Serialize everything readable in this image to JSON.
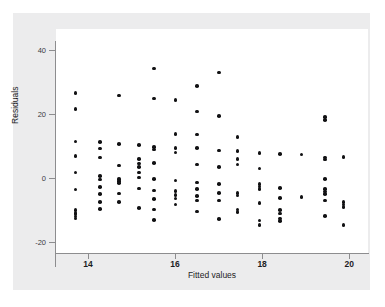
{
  "chart_data": {
    "type": "scatter",
    "title": "",
    "xlabel": "Fitted values",
    "ylabel": "Residuals",
    "xlim": [
      13.55,
      20.1
    ],
    "ylim": [
      -21.5,
      42.5
    ],
    "xticks": [
      14,
      16,
      18,
      20
    ],
    "yticks": [
      40,
      20,
      0,
      -20
    ],
    "xtick_labels": [
      "14",
      "16",
      "18",
      "20"
    ],
    "ytick_labels": [
      "40",
      "20",
      "0",
      "-20"
    ],
    "grid": false,
    "legend": null,
    "marker": "filled-circle",
    "marker_color": "#111113",
    "panel_color": "#ffffff",
    "figure_color": "#ececed",
    "points": [
      [
        13.72,
        26.5
      ],
      [
        13.72,
        21.5
      ],
      [
        13.72,
        11.5
      ],
      [
        13.72,
        7.0
      ],
      [
        13.72,
        1.8
      ],
      [
        13.72,
        -3.5
      ],
      [
        13.72,
        -10.0
      ],
      [
        13.72,
        -10.8
      ],
      [
        13.72,
        -11.4
      ],
      [
        13.72,
        -12.0
      ],
      [
        13.72,
        -12.6
      ],
      [
        14.28,
        11.2
      ],
      [
        14.28,
        9.2
      ],
      [
        14.28,
        6.4
      ],
      [
        14.28,
        0.6
      ],
      [
        14.28,
        -0.4
      ],
      [
        14.28,
        -2.8
      ],
      [
        14.28,
        -5.0
      ],
      [
        14.28,
        -7.4
      ],
      [
        14.28,
        -9.6
      ],
      [
        14.72,
        25.8
      ],
      [
        14.72,
        10.6
      ],
      [
        14.72,
        4.0
      ],
      [
        14.72,
        -0.2
      ],
      [
        14.72,
        -0.9
      ],
      [
        14.72,
        -1.6
      ],
      [
        14.72,
        -4.8
      ],
      [
        14.72,
        -7.4
      ],
      [
        15.18,
        10.4
      ],
      [
        15.18,
        6.0
      ],
      [
        15.18,
        4.6
      ],
      [
        15.18,
        3.4
      ],
      [
        15.18,
        1.8
      ],
      [
        15.18,
        0.2
      ],
      [
        15.18,
        -3.2
      ],
      [
        15.18,
        -9.4
      ],
      [
        15.52,
        34.2
      ],
      [
        15.52,
        24.8
      ],
      [
        15.52,
        9.8
      ],
      [
        15.52,
        9.0
      ],
      [
        15.52,
        4.8
      ],
      [
        15.52,
        -0.2
      ],
      [
        15.52,
        -3.8
      ],
      [
        15.52,
        -6.6
      ],
      [
        15.52,
        -9.8
      ],
      [
        15.52,
        -13.0
      ],
      [
        16.02,
        24.4
      ],
      [
        16.02,
        13.8
      ],
      [
        16.02,
        9.4
      ],
      [
        16.02,
        8.0
      ],
      [
        16.02,
        -0.8
      ],
      [
        16.02,
        -4.0
      ],
      [
        16.02,
        -5.2
      ],
      [
        16.02,
        -6.4
      ],
      [
        16.02,
        -8.2
      ],
      [
        16.52,
        28.8
      ],
      [
        16.52,
        20.8
      ],
      [
        16.52,
        13.6
      ],
      [
        16.52,
        9.4
      ],
      [
        16.52,
        4.2
      ],
      [
        16.52,
        -1.4
      ],
      [
        16.52,
        -3.4
      ],
      [
        16.52,
        -5.6
      ],
      [
        16.52,
        -7.0
      ],
      [
        16.52,
        -10.4
      ],
      [
        17.02,
        33.0
      ],
      [
        17.02,
        19.4
      ],
      [
        17.02,
        8.6
      ],
      [
        17.02,
        3.4
      ],
      [
        17.02,
        -1.8
      ],
      [
        17.02,
        -4.6
      ],
      [
        17.02,
        -7.0
      ],
      [
        17.02,
        -12.8
      ],
      [
        17.45,
        12.8
      ],
      [
        17.45,
        8.4
      ],
      [
        17.45,
        6.0
      ],
      [
        17.45,
        4.2
      ],
      [
        17.45,
        -4.6
      ],
      [
        17.45,
        -5.4
      ],
      [
        17.45,
        -9.8
      ],
      [
        17.45,
        -10.6
      ],
      [
        17.95,
        7.8
      ],
      [
        17.95,
        3.0
      ],
      [
        17.95,
        -1.8
      ],
      [
        17.95,
        -2.6
      ],
      [
        17.95,
        -3.4
      ],
      [
        17.95,
        -7.8
      ],
      [
        17.95,
        -13.2
      ],
      [
        17.95,
        -14.6
      ],
      [
        18.42,
        7.6
      ],
      [
        18.42,
        -3.0
      ],
      [
        18.42,
        -6.2
      ],
      [
        18.42,
        -10.0
      ],
      [
        18.42,
        -11.0
      ],
      [
        18.42,
        -12.6
      ],
      [
        18.42,
        -13.4
      ],
      [
        18.92,
        7.4
      ],
      [
        18.92,
        -5.8
      ],
      [
        19.45,
        19.0
      ],
      [
        19.45,
        18.2
      ],
      [
        19.45,
        6.4
      ],
      [
        19.45,
        5.8
      ],
      [
        19.45,
        -0.2
      ],
      [
        19.45,
        -3.4
      ],
      [
        19.45,
        -4.2
      ],
      [
        19.45,
        -5.0
      ],
      [
        19.45,
        -7.0
      ],
      [
        19.45,
        -11.8
      ],
      [
        19.88,
        6.6
      ],
      [
        19.88,
        -7.4
      ],
      [
        19.88,
        -8.2
      ],
      [
        19.88,
        -9.0
      ],
      [
        19.88,
        -14.6
      ]
    ]
  }
}
